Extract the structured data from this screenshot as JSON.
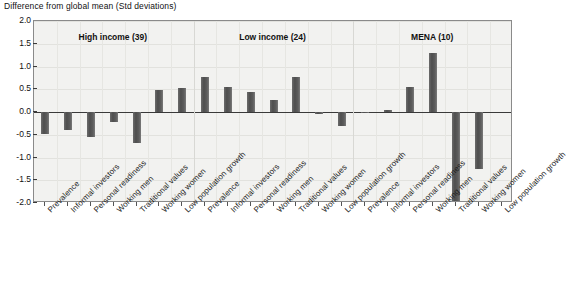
{
  "chart_data": {
    "type": "bar",
    "title": "Difference from global mean (Std deviations)",
    "xlabel": "",
    "ylabel": "Difference from global mean (Std deviations)",
    "ylim": [
      -2.0,
      2.0
    ],
    "ytick_labels": [
      "2.0",
      "1.5",
      "1.0",
      "0.5",
      "0.0",
      "-0.5",
      "-1.0",
      "-1.5",
      "-2.0"
    ],
    "ytick_values": [
      2.0,
      1.5,
      1.0,
      0.5,
      0.0,
      -0.5,
      -1.0,
      -1.5,
      -2.0
    ],
    "grid": true,
    "legend": "none",
    "categories": [
      "Prevalence",
      "Informal investors",
      "Personal readiness",
      "Working men",
      "Traditional values",
      "Working women",
      "Low population growth"
    ],
    "groups": [
      {
        "name": "High income (39)",
        "label": "High income (39)",
        "count": 39,
        "values": [
          -0.48,
          -0.4,
          -0.55,
          -0.22,
          -0.68,
          0.49,
          0.52
        ]
      },
      {
        "name": "Low income (24)",
        "label": "Low income (24)",
        "count": 24,
        "values": [
          0.78,
          0.56,
          0.45,
          0.27,
          0.76,
          -0.04,
          -0.3
        ]
      },
      {
        "name": "MENA (10)",
        "label": "MENA (10)",
        "count": 10,
        "values": [
          -0.03,
          0.05,
          0.55,
          1.3,
          -2.0,
          -1.25,
          0.0
        ]
      }
    ],
    "series": [
      {
        "name": "High income (39)",
        "values": [
          -0.48,
          -0.4,
          -0.55,
          -0.22,
          -0.68,
          0.49,
          0.52
        ]
      },
      {
        "name": "Low income (24)",
        "values": [
          0.78,
          0.56,
          0.45,
          0.27,
          0.76,
          -0.04,
          -0.3
        ]
      },
      {
        "name": "MENA (10)",
        "values": [
          -0.03,
          0.05,
          0.55,
          1.3,
          -2.0,
          -1.25,
          0.0
        ]
      }
    ],
    "colors": {
      "bar": "#5a5a5a",
      "plot_background": "#f2f2f0",
      "axis": "#3a3a3a",
      "grid": "#e2e2de",
      "text": "#111111"
    }
  }
}
